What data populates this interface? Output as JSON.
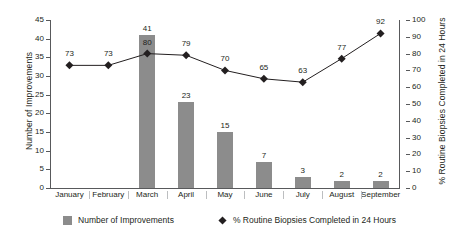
{
  "chart_data": {
    "type": "bar",
    "title": "",
    "categories": [
      "January",
      "February",
      "March",
      "April",
      "May",
      "June",
      "July",
      "August",
      "September"
    ],
    "series": [
      {
        "name": "Number of Improvements",
        "type": "bar",
        "axis": "left",
        "values": [
          0,
          0,
          41,
          23,
          15,
          7,
          3,
          2,
          2
        ],
        "color": "#8c8c8c"
      },
      {
        "name": "% Routine Biopsies Completed in 24 Hours",
        "type": "line",
        "axis": "right",
        "values": [
          73,
          73,
          80,
          79,
          70,
          65,
          63,
          77,
          92
        ],
        "color": "#231f20",
        "marker": "diamond"
      }
    ],
    "xlabel": "",
    "ylabel": "Number of Improvements",
    "y2label": "% Routine Biopsies Completed in 24 Hours",
    "ylim": [
      0,
      45
    ],
    "y2lim": [
      0,
      100
    ],
    "yticks": [
      0,
      5,
      10,
      15,
      20,
      25,
      30,
      35,
      40,
      45
    ],
    "y2ticks": [
      0,
      10,
      20,
      30,
      40,
      50,
      60,
      70,
      80,
      90,
      100
    ],
    "grid": false,
    "legend_position": "bottom"
  },
  "legend": {
    "bar_label": "Number of Improvements",
    "line_label": "% Routine Biopsies Completed in 24 Hours"
  }
}
